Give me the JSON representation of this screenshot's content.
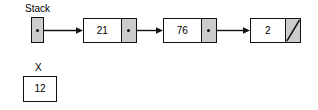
{
  "diagram": {
    "background_color": "#ffffff",
    "line_color": "#111111",
    "pointer_cell_color": "#cccccc",
    "data_cell_color": "#ffffff"
  },
  "stack": {
    "label": "Stack",
    "pointer_icon": "pointer-dot-icon"
  },
  "nodes": [
    {
      "value": "21",
      "pointer_type": "link",
      "pointer_icon": "pointer-dot-icon"
    },
    {
      "value": "76",
      "pointer_type": "link",
      "pointer_icon": "pointer-dot-icon"
    },
    {
      "value": "2",
      "pointer_type": "null",
      "pointer_icon": "null-slash-icon"
    }
  ],
  "arrows": [
    {
      "from": "stack-pointer",
      "to": "node-21",
      "icon": "arrow-right-icon"
    },
    {
      "from": "node-21",
      "to": "node-76",
      "icon": "arrow-right-icon"
    },
    {
      "from": "node-76",
      "to": "node-2",
      "icon": "arrow-right-icon"
    }
  ],
  "variable": {
    "label": "X",
    "value": "12"
  }
}
